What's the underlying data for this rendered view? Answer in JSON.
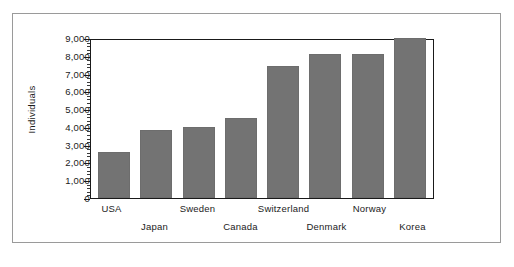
{
  "chart_data": {
    "type": "bar",
    "title": "",
    "subtitle": "",
    "xlabel": "",
    "ylabel": "Individuals",
    "categories": [
      "USA",
      "Japan",
      "Sweden",
      "Canada",
      "Switzerland",
      "Denmark",
      "Norway",
      "Korea"
    ],
    "values": [
      2600,
      3800,
      4000,
      4500,
      7400,
      8100,
      8100,
      9000
    ],
    "ylim": [
      0,
      9000
    ],
    "ytick_values": [
      0,
      1000,
      2000,
      3000,
      4000,
      5000,
      6000,
      7000,
      8000,
      9000
    ],
    "ytick_labels": [
      "0",
      "1,000",
      "2,000",
      "3,000",
      "4,000",
      "5,000",
      "6,000",
      "7,000",
      "8,000",
      "9,000"
    ],
    "minor_ticks_per_interval": 4,
    "grid": false,
    "legend": null,
    "legend_position": "none",
    "bar_color": "#737373",
    "axis_color": "#1a1a1a",
    "text_color": "#1b1b1b",
    "background_color": "#ffffff",
    "frame_color": "#9a9a9a",
    "xlabel_stagger": [
      0,
      1,
      0,
      1,
      0,
      1,
      0,
      1
    ]
  }
}
